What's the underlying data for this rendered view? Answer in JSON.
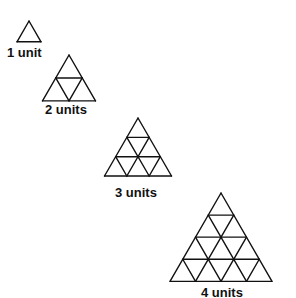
{
  "figures": [
    {
      "label": "1 unit",
      "size": 1,
      "apex": [
        29,
        21
      ],
      "side": 24,
      "label_pos": [
        7,
        46
      ]
    },
    {
      "label": "2 units",
      "size": 2,
      "apex": [
        69,
        55
      ],
      "side": 53,
      "label_pos": [
        45,
        103
      ]
    },
    {
      "label": "3 units",
      "size": 3,
      "apex": [
        138,
        118
      ],
      "side": 67,
      "label_pos": [
        115,
        186
      ]
    },
    {
      "label": "4 units",
      "size": 4,
      "apex": [
        221,
        193
      ],
      "side": 102,
      "label_pos": [
        201,
        286
      ]
    }
  ],
  "style": {
    "stroke": "#111111",
    "background": "#ffffff"
  }
}
